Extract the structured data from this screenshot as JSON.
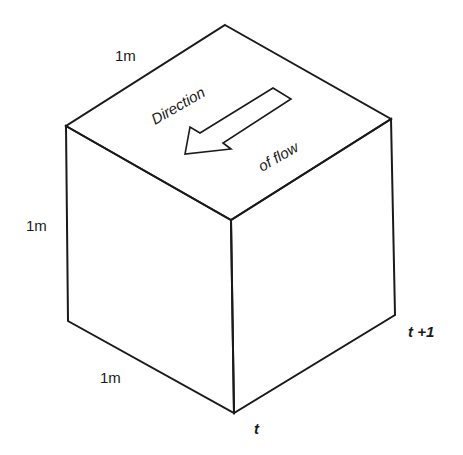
{
  "diagram": {
    "type": "isometric-cube",
    "labels": {
      "top_edge": "1m",
      "left_edge": "1m",
      "bottom_edge": "1m",
      "flow_line1": "Direction",
      "flow_line2": "of flow",
      "time_t": "t",
      "time_t_plus_1": "t +1"
    },
    "arrow": {
      "meaning": "direction-of-flow",
      "orientation": "down-left"
    },
    "colors": {
      "line": "#1a1a1a",
      "background": "#ffffff"
    }
  }
}
